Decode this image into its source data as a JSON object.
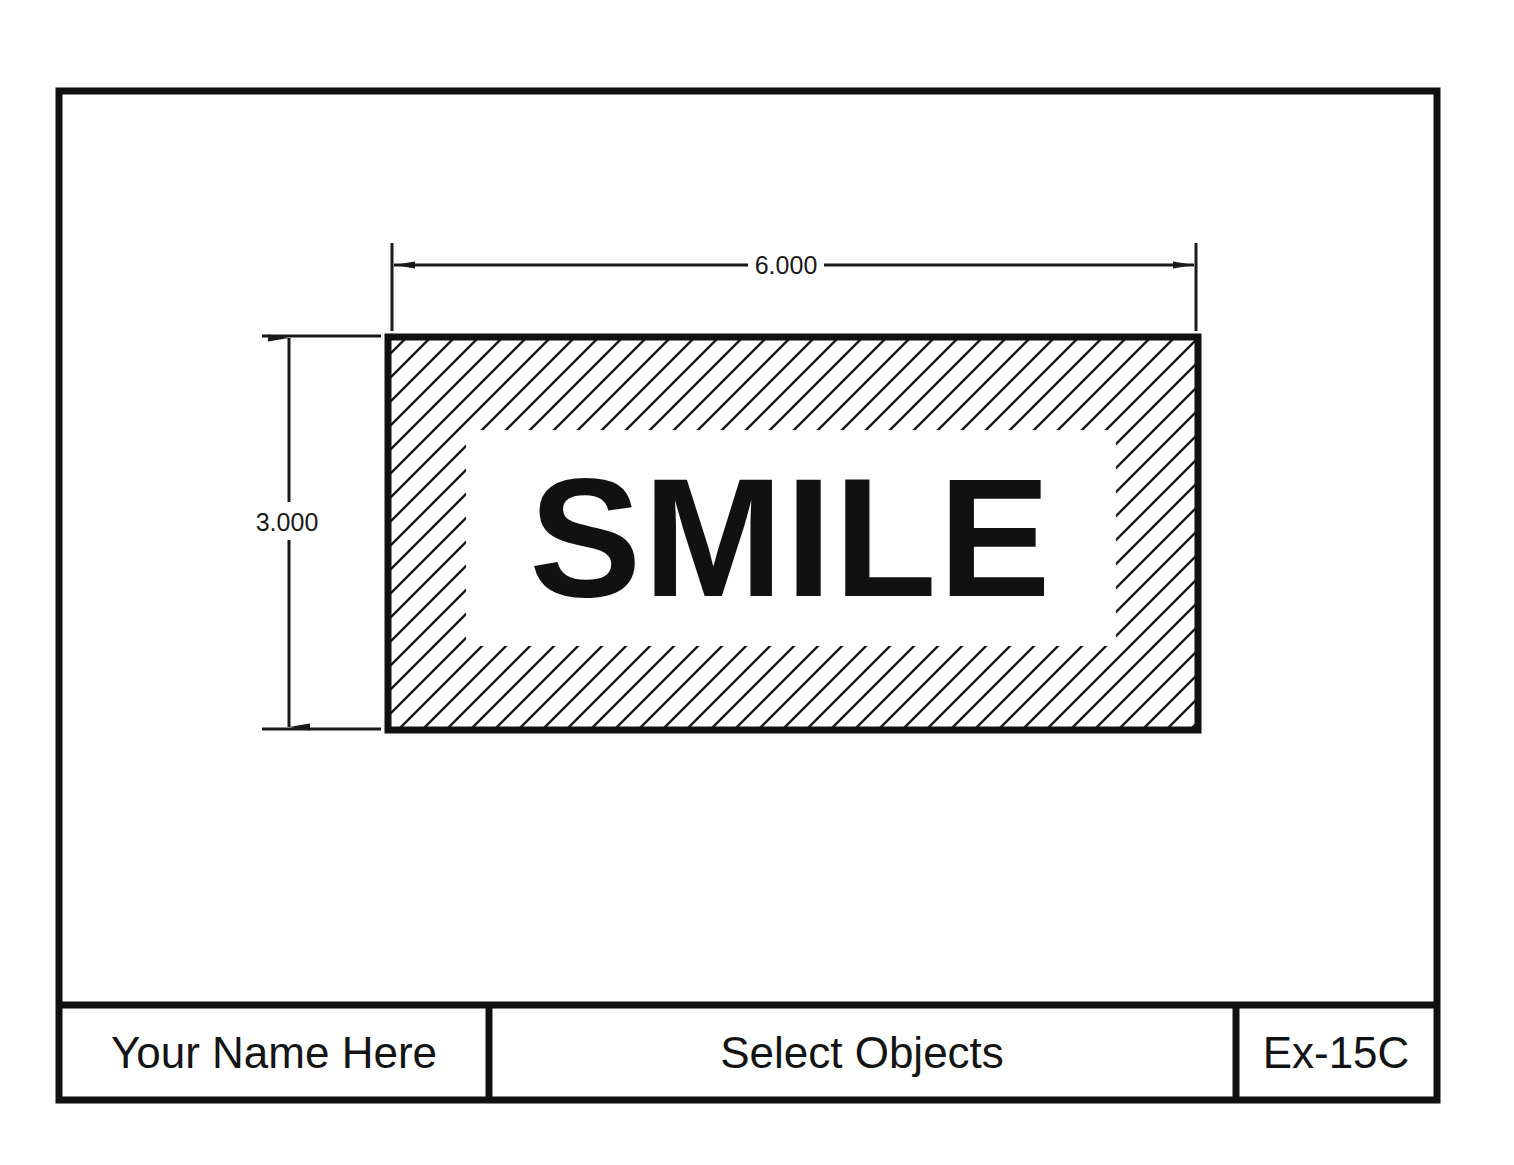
{
  "drawing": {
    "sheet": {
      "border_color": "#111111",
      "background_color": "#ffffff"
    },
    "part": {
      "label": "SMILE",
      "hatch_pattern": "diagonal-45",
      "hatch_color": "#1a1a1a",
      "outline_color": "#111111"
    },
    "dimensions": [
      {
        "name": "width",
        "value": "6.000",
        "orientation": "horizontal"
      },
      {
        "name": "height",
        "value": "3.000",
        "orientation": "vertical"
      }
    ],
    "title_block": {
      "name_cell": "Your Name Here",
      "title_cell": "Select Objects",
      "number_cell": "Ex-15C"
    }
  }
}
